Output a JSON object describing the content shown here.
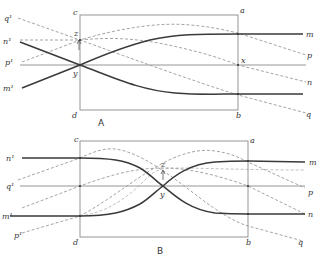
{
  "figure": {
    "panels": [
      {
        "id": "A",
        "caption": "A",
        "corner_labels": {
          "c": "c",
          "a": "a",
          "b": "b",
          "d": "d"
        },
        "point_labels": {
          "z": "z",
          "y": "y",
          "x": "x"
        },
        "left_labels": {
          "q": "q¹",
          "n": "n¹",
          "p": "p¹",
          "m": "m¹"
        },
        "right_labels": {
          "m": "m",
          "p": "p",
          "n": "n",
          "q": "q"
        }
      },
      {
        "id": "B",
        "caption": "B",
        "corner_labels": {
          "c": "c",
          "a": "a",
          "b": "b",
          "d": "d"
        },
        "point_labels": {
          "z": "z",
          "y": "y"
        },
        "left_labels": {
          "n": "n¹",
          "q": "q¹",
          "m": "m¹",
          "p": "p¹"
        },
        "right_labels": {
          "m": "m",
          "p": "p",
          "n": "n",
          "q": "q"
        }
      }
    ],
    "line_styles": {
      "solid_curves": [
        "m",
        "n"
      ],
      "dashed_curves": [
        "p",
        "q",
        "n-dashed"
      ],
      "solid_color": "#3a3a3a",
      "dashed_color": "#9a9a9a",
      "frame_color": "#8a8a8a"
    },
    "caption_fragment": ""
  }
}
